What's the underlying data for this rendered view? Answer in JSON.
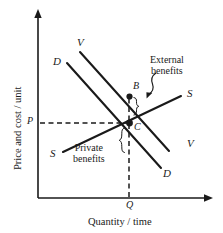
{
  "figure": {
    "domain": "diagram",
    "type": "economics-supply-demand-external-benefits",
    "background_color": "#ffffff",
    "ink_color": "#1a1a1a"
  },
  "axes": {
    "y_axis_title": "Price and cost / unit",
    "x_axis_title": "Quantity / time",
    "y_tick_label": "P",
    "x_tick_label": "Q"
  },
  "curves": [
    {
      "id": "demand-private-upper-left",
      "label": "D"
    },
    {
      "id": "value-social-upper-left",
      "label": "V"
    },
    {
      "id": "supply-lower-left",
      "label": "S"
    },
    {
      "id": "supply-upper-right",
      "label": "S"
    },
    {
      "id": "value-social-lower-right",
      "label": "V"
    },
    {
      "id": "demand-private-lower-right",
      "label": "D"
    }
  ],
  "points": [
    {
      "id": "point-b",
      "label": "B"
    },
    {
      "id": "point-c",
      "label": "C"
    }
  ],
  "annotations": [
    {
      "id": "external-benefits",
      "line1": "External",
      "line2": "benefits"
    },
    {
      "id": "private-benefits",
      "line1": "Private",
      "line2": "benefits"
    }
  ]
}
